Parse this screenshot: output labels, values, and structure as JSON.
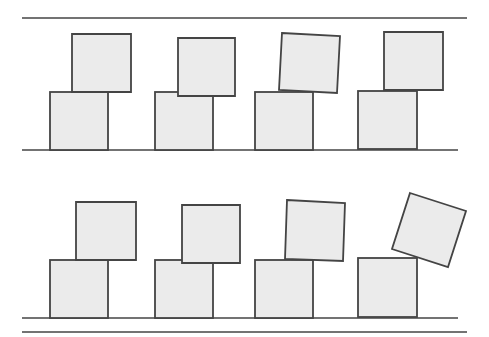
{
  "diagram": {
    "colors": {
      "background": "#ffffff",
      "block_fill": "#ebebeb",
      "block_stroke": "#444444",
      "line_stroke": "#444444"
    },
    "lines": [
      {
        "name": "top-boundary-line",
        "x1": 22,
        "y1": 18,
        "x2": 467,
        "y2": 18
      },
      {
        "name": "ground-line-row-1",
        "x1": 22,
        "y1": 150,
        "x2": 458,
        "y2": 150
      },
      {
        "name": "ground-line-row-2",
        "x1": 22,
        "y1": 318,
        "x2": 458,
        "y2": 318
      },
      {
        "name": "bottom-boundary-line",
        "x1": 22,
        "y1": 332,
        "x2": 467,
        "y2": 332
      }
    ],
    "rows": [
      {
        "name": "row-1",
        "stacks": [
          {
            "bottom": {
              "x": 50,
              "y": 92,
              "w": 58,
              "h": 58
            },
            "top": {
              "points": "72,34 131,34 131,92 72,92"
            }
          },
          {
            "bottom": {
              "x": 155,
              "y": 92,
              "w": 58,
              "h": 58
            },
            "top": {
              "points": "178,38 235,38 235,96 178,96"
            }
          },
          {
            "bottom": {
              "x": 255,
              "y": 92,
              "w": 58,
              "h": 58
            },
            "top": {
              "points": "282,33 340,36 337,93 279,90"
            }
          },
          {
            "bottom": {
              "x": 358,
              "y": 91,
              "w": 59,
              "h": 58
            },
            "top": {
              "points": "384,32 443,32 443,90 384,90"
            }
          }
        ]
      },
      {
        "name": "row-2",
        "stacks": [
          {
            "bottom": {
              "x": 50,
              "y": 260,
              "w": 58,
              "h": 58
            },
            "top": {
              "points": "76,202 136,202 136,260 76,260"
            }
          },
          {
            "bottom": {
              "x": 155,
              "y": 260,
              "w": 58,
              "h": 58
            },
            "top": {
              "points": "182,205 240,205 240,263 182,263"
            }
          },
          {
            "bottom": {
              "x": 255,
              "y": 260,
              "w": 58,
              "h": 58
            },
            "top": {
              "points": "287,200 345,203 343,261 285,259"
            }
          },
          {
            "bottom": {
              "x": 358,
              "y": 258,
              "w": 59,
              "h": 59
            },
            "top": {
              "points": "410,193 466,211 448,267 392,249"
            }
          }
        ]
      }
    ]
  }
}
